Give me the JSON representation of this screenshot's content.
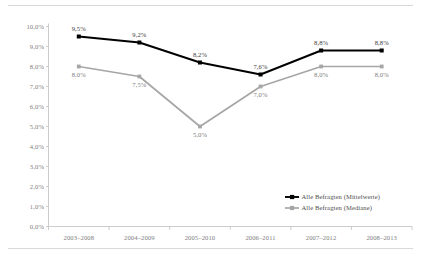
{
  "chart_data": {
    "type": "line",
    "title": "",
    "subtitle": "",
    "xlabel": "",
    "ylabel": "",
    "categories": [
      "2003–2008",
      "2004–2009",
      "2005–2010",
      "2006–2011",
      "2007–2012",
      "2008–2013"
    ],
    "series": [
      {
        "name": "Alle Befragten (Mittelwerte)",
        "color": "#000000",
        "marker": "square",
        "values": [
          9.5,
          9.2,
          8.2,
          7.6,
          8.8,
          8.8
        ],
        "labels": [
          "9,5%",
          "9,2%",
          "8,2%",
          "7,6%",
          "8,8%",
          "8,8%"
        ],
        "label_positions": [
          "above",
          "above",
          "above",
          "above",
          "above",
          "above"
        ]
      },
      {
        "name": "Alle Befragten (Mediane)",
        "color": "#a6a6a6",
        "marker": "square",
        "values": [
          8.0,
          7.5,
          5.0,
          7.0,
          8.0,
          8.0
        ],
        "labels": [
          "8,0%",
          "7,5%",
          "5,0%",
          "7,0%",
          "8,0%",
          "8,0%"
        ],
        "label_positions": [
          "below",
          "below",
          "below",
          "below",
          "below",
          "below"
        ]
      }
    ],
    "ylim": [
      0.0,
      10.0
    ],
    "ytick_values": [
      0.0,
      1.0,
      2.0,
      3.0,
      4.0,
      5.0,
      6.0,
      7.0,
      8.0,
      9.0,
      10.0
    ],
    "ytick_labels": [
      "0,0%",
      "1,0%",
      "2,0%",
      "3,0%",
      "4,0%",
      "5,0%",
      "6,0%",
      "7,0%",
      "8,0%",
      "9,0%",
      "10,0%"
    ],
    "grid": false,
    "legend_position": "inside-bottom-right",
    "axis_color": "#bfbfbf",
    "tick_label_color": "#808080",
    "background": "#ffffff",
    "frame_rule_color": "#d9d9d9"
  }
}
